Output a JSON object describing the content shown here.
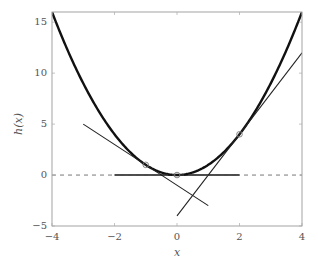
{
  "chart_data": {
    "type": "line",
    "title": "",
    "xlabel": "x",
    "ylabel": "h(x)",
    "xlim": [
      -4,
      4
    ],
    "ylim": [
      -5,
      16
    ],
    "xticks": [
      -4,
      -2,
      0,
      2,
      4
    ],
    "yticks": [
      -5,
      0,
      5,
      10,
      15
    ],
    "grid": false,
    "legend": null,
    "series": [
      {
        "name": "h(x) = x^2",
        "style": "thick solid",
        "function": "x^2",
        "x": [
          -4,
          -3,
          -2,
          -1,
          0,
          1,
          2,
          3,
          4
        ],
        "y": [
          16,
          9,
          4,
          1,
          0,
          1,
          4,
          9,
          16
        ]
      },
      {
        "name": "tangent at x=-1",
        "style": "thin solid",
        "function": "-2x - 1",
        "x": [
          -3,
          1
        ],
        "y": [
          5,
          -3
        ]
      },
      {
        "name": "tangent at x=0",
        "style": "medium solid",
        "function": "0",
        "x": [
          -2,
          2
        ],
        "y": [
          0,
          0
        ]
      },
      {
        "name": "tangent at x=2",
        "style": "thin solid",
        "function": "4x - 4",
        "x": [
          0,
          4
        ],
        "y": [
          -4,
          12
        ]
      },
      {
        "name": "y = 0 reference",
        "style": "dashed",
        "x": [
          -4,
          4
        ],
        "y": [
          0,
          0
        ]
      }
    ],
    "markers": [
      {
        "x": -1,
        "y": 1
      },
      {
        "x": 0,
        "y": 0
      },
      {
        "x": 2,
        "y": 4
      }
    ]
  },
  "labels": {
    "xlabel": "x",
    "ylabel": "h(x)",
    "xticks": [
      "−4",
      "−2",
      "0",
      "2",
      "4"
    ],
    "yticks": [
      "−5",
      "0",
      "5",
      "10",
      "15"
    ]
  }
}
